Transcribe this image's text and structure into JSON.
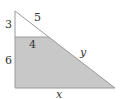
{
  "diagram": {
    "title": "",
    "labels": {
      "upper_left_side": "3",
      "upper_hypotenuse": "5",
      "inner_top_edge": "4",
      "lower_left_side": "6",
      "lower_hypotenuse": "y",
      "bottom_edge": "x"
    },
    "colors": {
      "stroke": "#9a9a9a",
      "shaded_fill": "#c8c8c8",
      "background": "#ffffff",
      "text": "#333333"
    }
  }
}
